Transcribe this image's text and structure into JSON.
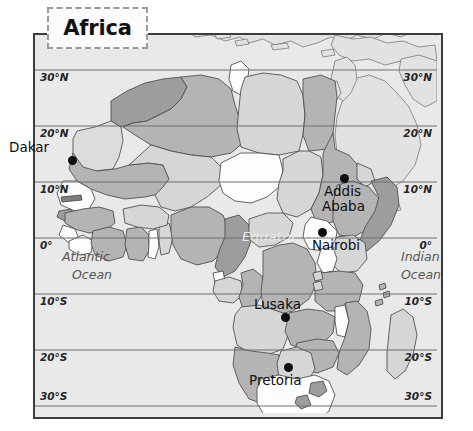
{
  "map": {
    "title": "Africa",
    "frame": {
      "border_color": "#3c3c3c",
      "ocean_fill": "#e9e9e9"
    },
    "palette": {
      "land_light": "#d6d6d6",
      "land_medium": "#b4b4b4",
      "land_dark": "#9d9d9d",
      "land_white": "#fdfdfd",
      "outside_africa": "#e2e2e2",
      "border_line": "#4a4a4a",
      "grid_line": "#6e6e6e",
      "city_dot": "#0d0d0d",
      "label_text": "#0d0d0d",
      "ocean_text": "#565656",
      "equator_text": "#e8e8e8"
    },
    "graticule": {
      "latitudes_left": [
        "30°N",
        "20°N",
        "10°N",
        "0°",
        "10°S",
        "20°S",
        "30°S"
      ],
      "latitudes_right": [
        "30°N",
        "20°N",
        "10°N",
        "0°",
        "10°S",
        "20°S",
        "30°S"
      ]
    },
    "feature_labels": [
      {
        "name": "atlantic-ocean",
        "line1": "Atlantic",
        "line2": "Ocean"
      },
      {
        "name": "indian-ocean",
        "line1": "Indian",
        "line2": "Ocean"
      },
      {
        "name": "equator",
        "text": "Equator"
      }
    ],
    "cities": [
      {
        "name": "Dakar",
        "label_position": "left-of-dot"
      },
      {
        "name": "Addis Ababa",
        "line1": "Addis",
        "line2": "Ababa",
        "label_position": "below-dot"
      },
      {
        "name": "Nairobi",
        "label_position": "below-dot"
      },
      {
        "name": "Lusaka",
        "label_position": "above-dot"
      },
      {
        "name": "Pretoria",
        "label_position": "below-dot"
      }
    ]
  }
}
